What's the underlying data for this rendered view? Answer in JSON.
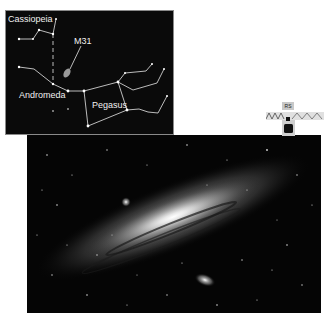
{
  "finder_chart": {
    "labels": {
      "cassiopeia": "Cassiopeia",
      "m31": "M31",
      "andromeda": "Andromeda",
      "pegasus": "Pegasus"
    }
  },
  "photo": {
    "subject": "Andromeda Galaxy (M31)"
  },
  "scale_indicator": {
    "label": "RS",
    "icon": "binoculars-icon"
  },
  "colors": {
    "background": "#ffffff",
    "sky": "#050505",
    "line": "#e8e8e8"
  }
}
